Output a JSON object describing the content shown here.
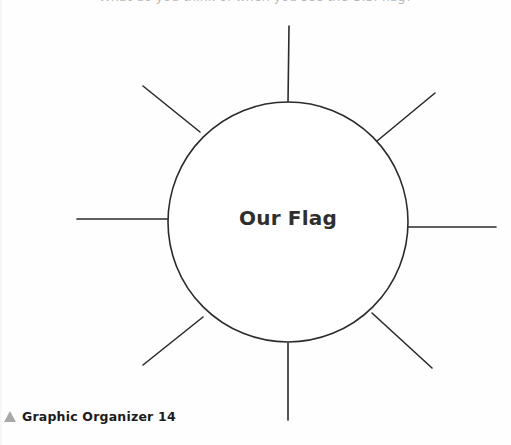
{
  "page": {
    "background_color": "#fefefe",
    "ink_color": "#2b2b2b"
  },
  "instruction": {
    "text": "What do you think of when you see the U.S. flag?",
    "note": "clipped at top edge of page"
  },
  "organizer": {
    "type": "web-graphic-organizer",
    "center_label": "Our Flag",
    "center": {
      "x": 288,
      "y": 222
    },
    "radius": 120,
    "circle_color": "#2b2b2b",
    "circle_stroke_width": 1.6,
    "spoke_color": "#2b2b2b",
    "spoke_stroke_width": 1.6,
    "spoke_count": 8,
    "spokes": [
      {
        "name": "spoke-n",
        "angle_deg": 270,
        "inner": {
          "x": 288,
          "y": 103
        },
        "outer": {
          "x": 289,
          "y": 26
        }
      },
      {
        "name": "spoke-ne",
        "angle_deg": 315,
        "inner": {
          "x": 377,
          "y": 141
        },
        "outer": {
          "x": 435,
          "y": 93
        }
      },
      {
        "name": "spoke-e",
        "angle_deg": 0,
        "inner": {
          "x": 405,
          "y": 227
        },
        "outer": {
          "x": 496,
          "y": 227
        }
      },
      {
        "name": "spoke-se",
        "angle_deg": 45,
        "inner": {
          "x": 372,
          "y": 313
        },
        "outer": {
          "x": 432,
          "y": 368
        }
      },
      {
        "name": "spoke-s",
        "angle_deg": 90,
        "inner": {
          "x": 288,
          "y": 343
        },
        "outer": {
          "x": 288,
          "y": 420
        }
      },
      {
        "name": "spoke-sw",
        "angle_deg": 135,
        "inner": {
          "x": 203,
          "y": 317
        },
        "outer": {
          "x": 143,
          "y": 365
        }
      },
      {
        "name": "spoke-w",
        "angle_deg": 180,
        "inner": {
          "x": 168,
          "y": 219
        },
        "outer": {
          "x": 77,
          "y": 219
        }
      },
      {
        "name": "spoke-nw",
        "angle_deg": 225,
        "inner": {
          "x": 200,
          "y": 132
        },
        "outer": {
          "x": 143,
          "y": 86
        }
      }
    ]
  },
  "footer": {
    "label": "Graphic Organizer 14",
    "marker_icon": "triangle-up-icon",
    "marker_color": "#a8a8a8"
  }
}
